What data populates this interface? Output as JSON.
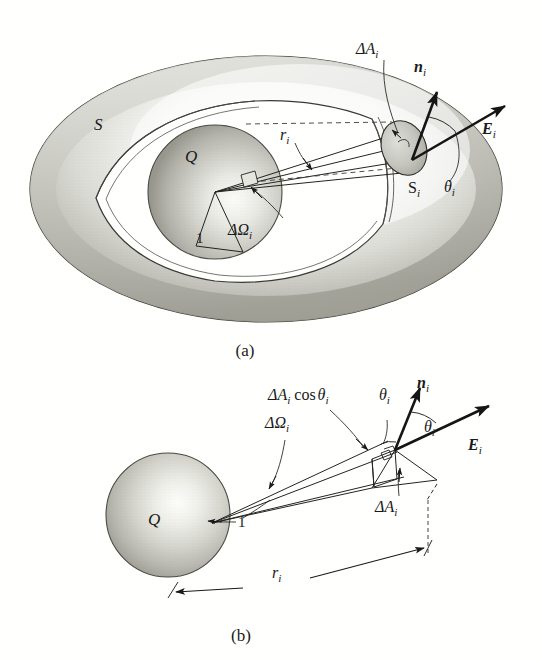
{
  "figure": {
    "background_color": "#fffffd",
    "ink_color": "#1a1a1a",
    "panels": [
      {
        "id": "panel-a",
        "caption": "(a)",
        "description": "Arbitrary closed surface S enclosing charge Q, cut away to show unit sphere and solid angle cone",
        "labels": {
          "surface": "S",
          "charge": "Q",
          "unit_radius": "1",
          "distance": "r",
          "distance_sub": "i",
          "solid_angle_delta": "ΔΩ",
          "solid_angle_sub": "i",
          "patch_area_delta": "ΔA",
          "patch_area_sub": "i",
          "patch_surface": "S",
          "patch_surface_sub": "i",
          "normal_vector": "n",
          "normal_sub": "i",
          "field_vector": "E",
          "field_sub": "i",
          "angle": "θ",
          "angle_sub": "i"
        }
      },
      {
        "id": "panel-b",
        "caption": "(b)",
        "description": "Detail of the solid angle cone showing projected area dA cos theta",
        "labels": {
          "charge": "Q",
          "unit_radius": "1",
          "distance": "r",
          "distance_sub": "i",
          "solid_angle_delta": "ΔΩ",
          "solid_angle_sub": "i",
          "projected_area": "ΔA",
          "projected_area_sub": "i",
          "projected_area_cos": "cos",
          "projected_area_theta": "θ",
          "projected_area_theta_sub": "i",
          "patch_area_delta": "ΔA",
          "patch_area_sub": "i",
          "normal_vector": "n",
          "normal_sub": "i",
          "field_vector": "E",
          "field_sub": "i",
          "angle_left": "θ",
          "angle_left_sub": "i",
          "angle_right": "θ",
          "angle_right_sub": "i"
        }
      }
    ],
    "colors": {
      "ink": "#1a1a1a",
      "sphere_light": "#f2f2ef",
      "sphere_mid": "#c9c9c4",
      "sphere_dark": "#98988f",
      "shell_light": "#fbfbf8",
      "shell_mid": "#cfcfc9",
      "shell_dark": "#9a9a92",
      "patch_fill": "#c4c4bd",
      "stroke": "#33332f"
    }
  }
}
